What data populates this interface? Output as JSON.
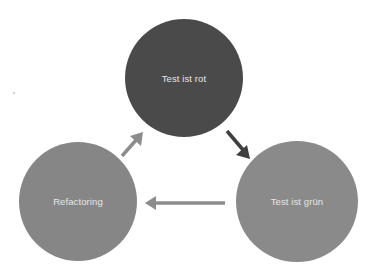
{
  "diagram": {
    "type": "cycle",
    "nodes": [
      {
        "id": "red",
        "label": "Test ist rot",
        "color": "#4a4a4a"
      },
      {
        "id": "green",
        "label": "Test ist grün",
        "color": "#8a8a8a"
      },
      {
        "id": "refactor",
        "label": "Refactoring",
        "color": "#868686"
      }
    ],
    "edges": [
      {
        "from": "red",
        "to": "green",
        "color": "#3f3f3f"
      },
      {
        "from": "green",
        "to": "refactor",
        "color": "#8c8c8c"
      },
      {
        "from": "refactor",
        "to": "red",
        "color": "#8c8c8c"
      }
    ]
  }
}
